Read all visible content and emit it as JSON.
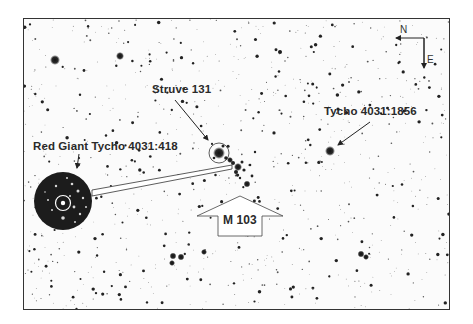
{
  "chart": {
    "kind": "astronomical finder chart (inverted star field)",
    "background_color": "#fbfbfb",
    "star_color": "#1e1e1e",
    "inset_background": "#1c1c1c"
  },
  "compass": {
    "north_label": "N",
    "east_label": "E"
  },
  "annotations": {
    "struve": "Struve 131",
    "tycho_1856": "Tycho 4031:1856",
    "red_giant": "Red Giant Tycho 4031:418",
    "cluster": "M 103"
  },
  "bright_stars": [
    {
      "name": "star-upper-left-1",
      "x": 55,
      "y": 60,
      "r": 5
    },
    {
      "name": "star-upper-left-2",
      "x": 120,
      "y": 56,
      "r": 4
    },
    {
      "name": "star-upper-mid",
      "x": 280,
      "y": 52,
      "r": 2.5
    },
    {
      "name": "tycho-4031-1856",
      "x": 330,
      "y": 151,
      "r": 5
    },
    {
      "name": "struve-131",
      "x": 219,
      "y": 153,
      "r": 6
    },
    {
      "name": "cluster-star-1",
      "x": 238,
      "y": 167,
      "r": 4
    },
    {
      "name": "cluster-star-2",
      "x": 247,
      "y": 184,
      "r": 3.5
    },
    {
      "name": "cluster-star-3",
      "x": 230,
      "y": 160,
      "r": 3
    },
    {
      "name": "lower-pair-1",
      "x": 173,
      "y": 256,
      "r": 3.5
    },
    {
      "name": "lower-pair-2",
      "x": 181,
      "y": 257,
      "r": 3.5
    },
    {
      "name": "lower-pair-3",
      "x": 172,
      "y": 263,
      "r": 3
    },
    {
      "name": "lower-mid",
      "x": 204,
      "y": 252,
      "r": 3
    },
    {
      "name": "lower-right-1",
      "x": 361,
      "y": 254,
      "r": 3.5
    },
    {
      "name": "lower-right-2",
      "x": 366,
      "y": 257,
      "r": 3
    }
  ]
}
